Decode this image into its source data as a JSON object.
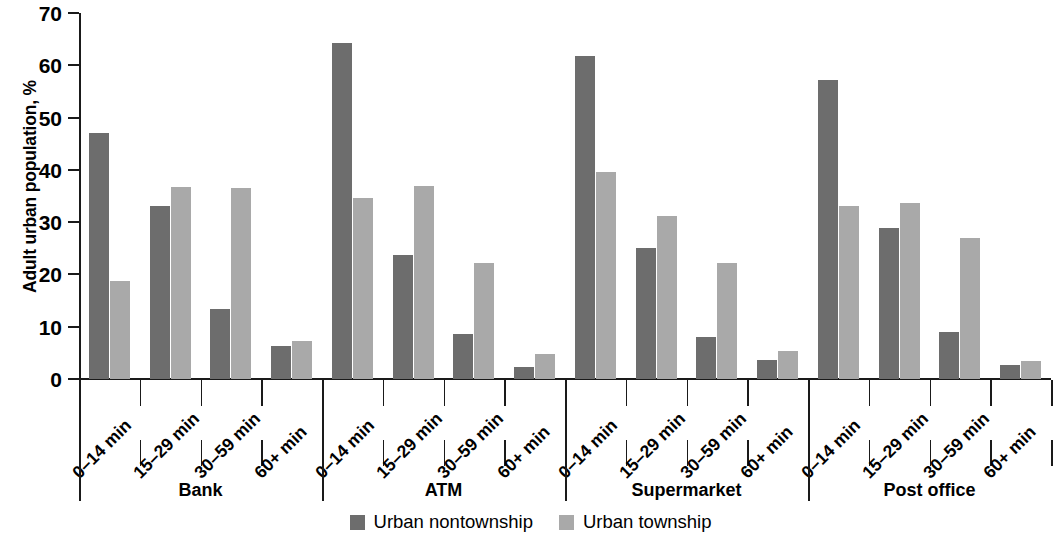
{
  "chart_data": {
    "type": "bar",
    "title": "",
    "subtitle": "",
    "xlabel": "",
    "ylabel": "Adult urban population, %",
    "ylim": [
      0,
      70
    ],
    "yticks": [
      0,
      10,
      20,
      30,
      40,
      50,
      60,
      70
    ],
    "grid": false,
    "legend_position": "bottom-center",
    "categories": [
      "0–14 min",
      "15–29 min",
      "30–59 min",
      "60+ min",
      "0–14 min",
      "15–29 min",
      "30–59 min",
      "60+ min",
      "0–14 min",
      "15–29 min",
      "30–59 min",
      "60+ min",
      "0–14 min",
      "15–29 min",
      "30–59 min",
      "60+ min"
    ],
    "groups": [
      {
        "label": "Bank",
        "categories": [
          "0–14 min",
          "15–29 min",
          "30–59 min",
          "60+ min"
        ]
      },
      {
        "label": "ATM",
        "categories": [
          "0–14 min",
          "15–29 min",
          "30–59 min",
          "60+ min"
        ]
      },
      {
        "label": "Supermarket",
        "categories": [
          "0–14 min",
          "15–29 min",
          "30–59 min",
          "60+ min"
        ]
      },
      {
        "label": "Post office",
        "categories": [
          "0–14 min",
          "15–29 min",
          "30–59 min",
          "60+ min"
        ]
      }
    ],
    "series": [
      {
        "name": "Urban nontownship",
        "color": "#6d6d6d",
        "values": [
          47.0,
          33.0,
          13.3,
          6.4,
          64.3,
          23.8,
          8.7,
          2.3,
          61.7,
          25.0,
          8.1,
          3.7,
          57.2,
          28.8,
          8.9,
          2.6
        ]
      },
      {
        "name": "Urban township",
        "color": "#a9a9a9",
        "values": [
          18.8,
          36.8,
          36.6,
          7.2,
          34.6,
          37.0,
          22.2,
          4.8,
          39.5,
          31.1,
          22.2,
          5.4,
          33.0,
          33.7,
          27.0,
          3.5
        ]
      }
    ]
  },
  "legend": {
    "items": [
      {
        "label": "Urban nontownship",
        "swatch": "dark"
      },
      {
        "label": "Urban township",
        "swatch": "light"
      }
    ]
  }
}
